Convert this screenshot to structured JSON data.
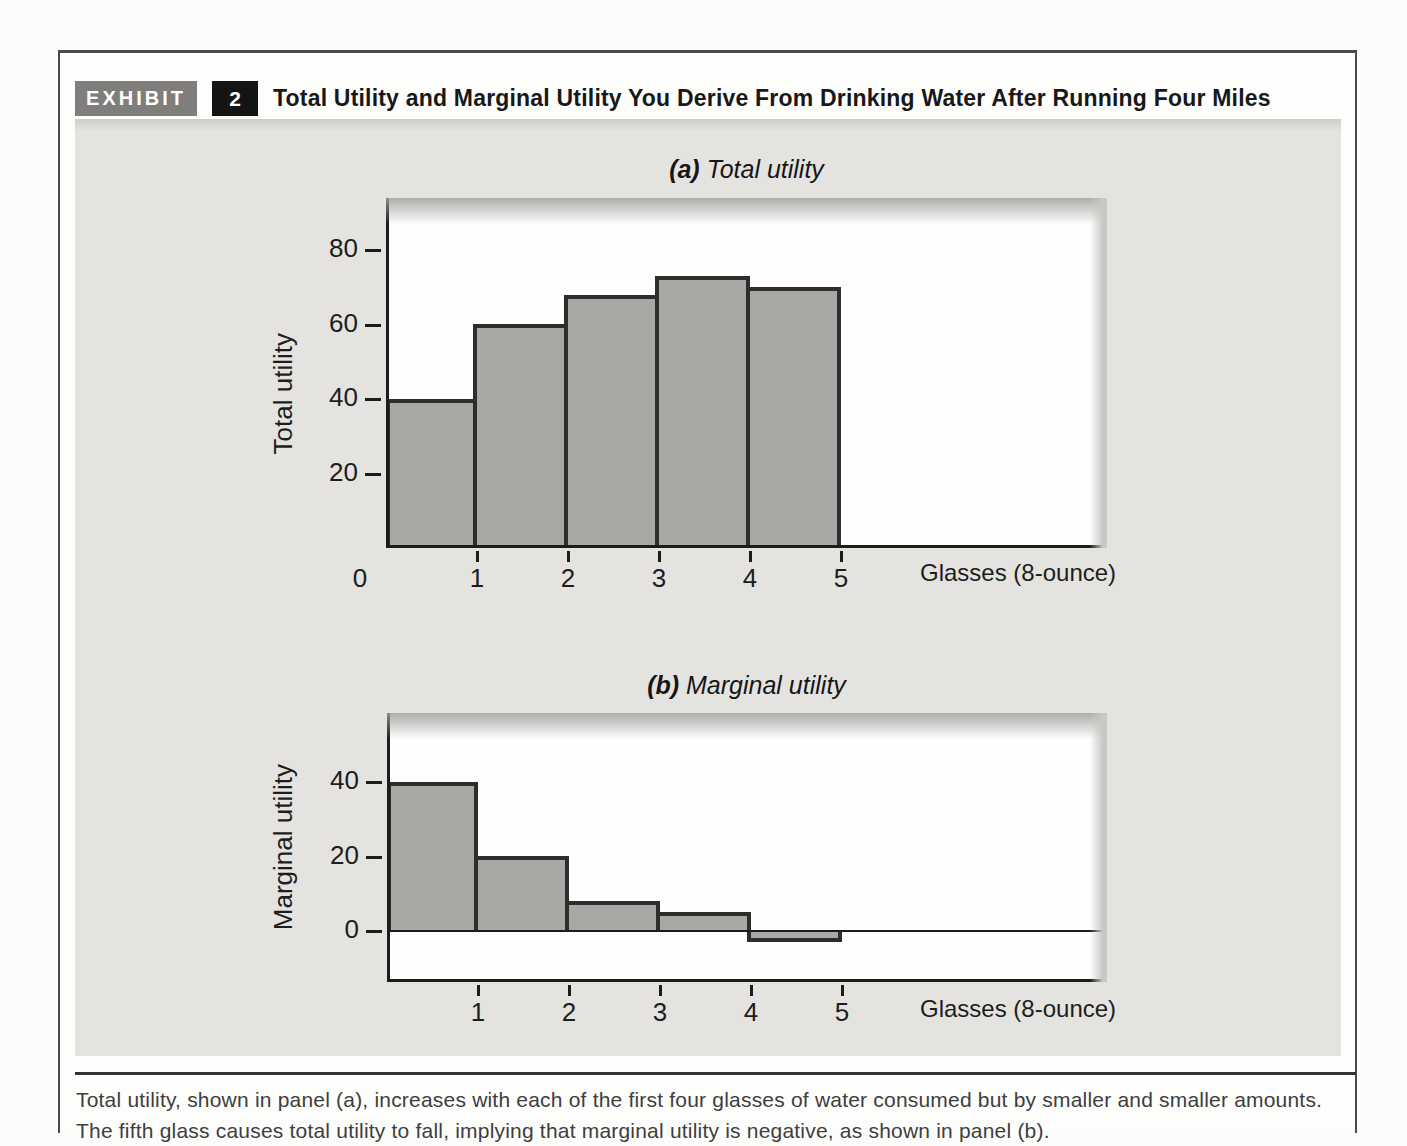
{
  "exhibit": {
    "label": "EXHIBIT",
    "number": "2",
    "title": "Total Utility and Marginal Utility You Derive From Drinking Water After Running Four Miles"
  },
  "chart_data": [
    {
      "panel": "a",
      "type": "bar",
      "title_prefix": "(a)",
      "title": "Total utility",
      "ylabel": "Total utility",
      "xlabel": "Glasses (8-ounce)",
      "categories": [
        1,
        2,
        3,
        4,
        5
      ],
      "values": [
        40,
        60,
        68,
        73,
        70
      ],
      "yticks": [
        20,
        40,
        60,
        80
      ],
      "xticks": [
        0,
        1,
        2,
        3,
        4,
        5
      ],
      "ylim": [
        0,
        94
      ],
      "grid": false,
      "legend": false
    },
    {
      "panel": "b",
      "type": "bar",
      "title_prefix": "(b)",
      "title": "Marginal utility",
      "ylabel": "Marginal utility",
      "xlabel": "Glasses (8-ounce)",
      "categories": [
        1,
        2,
        3,
        4,
        5
      ],
      "values": [
        40,
        20,
        8,
        5,
        -3
      ],
      "yticks": [
        0,
        20,
        40
      ],
      "xticks": [
        1,
        2,
        3,
        4,
        5
      ],
      "ylim": [
        -14,
        58
      ],
      "grid": false,
      "legend": false
    }
  ],
  "caption": {
    "text": "Total utility, shown in panel (a), increases with each of the first four glasses of water consumed but by smaller and smaller amounts. The fifth glass causes total utility to fall, implying that marginal utility is negative, as shown in panel (b)."
  },
  "colors": {
    "bar_fill": "#a9a8a5",
    "bar_border": "#2e2d2b",
    "axis": "#1c1c1c",
    "panel_background": "#e4e3e0",
    "plot_background": "#fefefe",
    "badge_background": "#7f7e7c",
    "number_badge_background": "#141414"
  }
}
